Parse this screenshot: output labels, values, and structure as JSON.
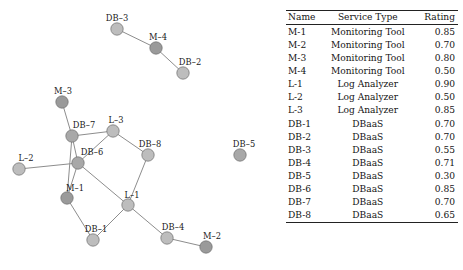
{
  "figure": {
    "caption": "",
    "background": "#ffffff"
  },
  "graph": {
    "title": "",
    "node_colors": {
      "monitoring": "#9a9a9a",
      "other": "#bdbdbd",
      "stroke": "#6f6f6f"
    },
    "edge_color": "#8d8d8d",
    "nodes": [
      {
        "id": "DB-3",
        "label": "DB–3",
        "x": 117,
        "y": 29,
        "r": 6.2,
        "color": "#bdbdbd",
        "label_dx": 0,
        "label_dy": -8.5,
        "label_anchor": "middle"
      },
      {
        "id": "M-4",
        "label": "M–4",
        "x": 156,
        "y": 48,
        "r": 6.2,
        "color": "#9a9a9a",
        "label_dx": 2,
        "label_dy": -8.5,
        "label_anchor": "middle"
      },
      {
        "id": "DB-2",
        "label": "DB–2",
        "x": 183,
        "y": 73,
        "r": 6.2,
        "color": "#bdbdbd",
        "label_dx": 7,
        "label_dy": -8.5,
        "label_anchor": "middle"
      },
      {
        "id": "M-3",
        "label": "M–3",
        "x": 62,
        "y": 102,
        "r": 6.2,
        "color": "#9a9a9a",
        "label_dx": 1,
        "label_dy": -8.5,
        "label_anchor": "middle"
      },
      {
        "id": "DB-7",
        "label": "DB–7",
        "x": 72,
        "y": 136,
        "r": 6.2,
        "color": "#a8a8a8",
        "label_dx": 12,
        "label_dy": -8.0,
        "label_anchor": "middle"
      },
      {
        "id": "L-3",
        "label": "L–3",
        "x": 113,
        "y": 131,
        "r": 6.2,
        "color": "#bdbdbd",
        "label_dx": 3,
        "label_dy": -8.0,
        "label_anchor": "middle"
      },
      {
        "id": "DB-6",
        "label": "DB–6",
        "x": 78,
        "y": 163,
        "r": 6.2,
        "color": "#a8a8a8",
        "label_dx": 14,
        "label_dy": -8.0,
        "label_anchor": "middle"
      },
      {
        "id": "DB-8",
        "label": "DB–8",
        "x": 148,
        "y": 155,
        "r": 6.2,
        "color": "#bdbdbd",
        "label_dx": 2,
        "label_dy": -8.5,
        "label_anchor": "middle"
      },
      {
        "id": "L-2",
        "label": "L–2",
        "x": 19,
        "y": 169,
        "r": 6.2,
        "color": "#bdbdbd",
        "label_dx": 7,
        "label_dy": -8.0,
        "label_anchor": "middle"
      },
      {
        "id": "M-1",
        "label": "M–1",
        "x": 67,
        "y": 198,
        "r": 6.2,
        "color": "#9a9a9a",
        "label_dx": 8,
        "label_dy": -7.5,
        "label_anchor": "middle"
      },
      {
        "id": "L-1",
        "label": "L–1",
        "x": 128,
        "y": 205,
        "r": 6.2,
        "color": "#bdbdbd",
        "label_dx": 4,
        "label_dy": -7.5,
        "label_anchor": "middle"
      },
      {
        "id": "DB-1",
        "label": "DB–1",
        "x": 93,
        "y": 240,
        "r": 6.2,
        "color": "#bdbdbd",
        "label_dx": 3,
        "label_dy": -8.5,
        "label_anchor": "middle"
      },
      {
        "id": "DB-4",
        "label": "DB–4",
        "x": 167,
        "y": 238,
        "r": 6.2,
        "color": "#bdbdbd",
        "label_dx": 6,
        "label_dy": -8.5,
        "label_anchor": "middle"
      },
      {
        "id": "M-2",
        "label": "M–2",
        "x": 206,
        "y": 247,
        "r": 6.2,
        "color": "#9a9a9a",
        "label_dx": 6,
        "label_dy": -8.0,
        "label_anchor": "middle"
      },
      {
        "id": "DB-5",
        "label": "DB–5",
        "x": 240,
        "y": 155,
        "r": 6.2,
        "color": "#a8a8a8",
        "label_dx": 4,
        "label_dy": -8.5,
        "label_anchor": "middle"
      }
    ],
    "edges": [
      {
        "source": "DB-3",
        "target": "M-4"
      },
      {
        "source": "M-4",
        "target": "DB-2"
      },
      {
        "source": "M-3",
        "target": "DB-7"
      },
      {
        "source": "DB-7",
        "target": "L-3"
      },
      {
        "source": "DB-7",
        "target": "DB-6"
      },
      {
        "source": "DB-7",
        "target": "M-1"
      },
      {
        "source": "L-3",
        "target": "DB-6"
      },
      {
        "source": "L-3",
        "target": "DB-8"
      },
      {
        "source": "DB-6",
        "target": "L-2"
      },
      {
        "source": "DB-6",
        "target": "M-1"
      },
      {
        "source": "DB-6",
        "target": "L-1"
      },
      {
        "source": "DB-8",
        "target": "L-1"
      },
      {
        "source": "M-1",
        "target": "DB-1"
      },
      {
        "source": "L-1",
        "target": "DB-1"
      },
      {
        "source": "L-1",
        "target": "DB-4"
      },
      {
        "source": "DB-4",
        "target": "M-2"
      }
    ]
  },
  "table": {
    "columns": [
      "Name",
      "Service Type",
      "Rating"
    ],
    "rows": [
      {
        "name": "M-1",
        "type": "Monitoring Tool",
        "rating": "0.85"
      },
      {
        "name": "M-2",
        "type": "Monitoring Tool",
        "rating": "0.70"
      },
      {
        "name": "M-3",
        "type": "Monitoring Tool",
        "rating": "0.80"
      },
      {
        "name": "M-4",
        "type": "Monitoring Tool",
        "rating": "0.50"
      },
      {
        "name": "L-1",
        "type": "Log Analyzer",
        "rating": "0.90"
      },
      {
        "name": "L-2",
        "type": "Log Analyzer",
        "rating": "0.50"
      },
      {
        "name": "L-3",
        "type": "Log Analyzer",
        "rating": "0.85"
      },
      {
        "name": "DB-1",
        "type": "DBaaS",
        "rating": "0.70"
      },
      {
        "name": "DB-2",
        "type": "DBaaS",
        "rating": "0.70"
      },
      {
        "name": "DB-3",
        "type": "DBaaS",
        "rating": "0.55"
      },
      {
        "name": "DB-4",
        "type": "DBaaS",
        "rating": "0.71"
      },
      {
        "name": "DB-5",
        "type": "DBaaS",
        "rating": "0.30"
      },
      {
        "name": "DB-6",
        "type": "DBaaS",
        "rating": "0.85"
      },
      {
        "name": "DB-7",
        "type": "DBaaS",
        "rating": "0.70"
      },
      {
        "name": "DB-8",
        "type": "DBaaS",
        "rating": "0.65"
      }
    ]
  }
}
